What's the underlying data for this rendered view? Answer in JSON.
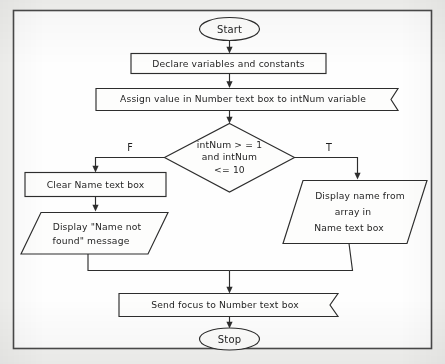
{
  "diagram": {
    "type": "flowchart",
    "frame": {
      "label": "diagram-border"
    },
    "colors": {
      "page_background": "#f3f3f1",
      "canvas": "#fefefe",
      "stroke": "#2d2d2d",
      "frame_stroke": "#4a4a4a",
      "text": "#1f1f1f"
    },
    "nodes": [
      {
        "id": "start",
        "shape": "terminal-oval",
        "name": "start-terminal",
        "text": "Start"
      },
      {
        "id": "declare",
        "shape": "process-rectangle",
        "name": "declare-process",
        "text": "Declare variables and constants"
      },
      {
        "id": "assign",
        "shape": "process-banner",
        "name": "assign-process",
        "text": "Assign value in Number text box to intNum variable"
      },
      {
        "id": "decision",
        "shape": "decision-diamond",
        "name": "range-decision",
        "lines": [
          "intNum > = 1",
          "and intNum",
          "<= 10"
        ]
      },
      {
        "id": "clear",
        "shape": "process-rectangle",
        "name": "clear-name-process",
        "text": "Clear Name text box"
      },
      {
        "id": "not-found",
        "shape": "output-parallelogram",
        "name": "name-not-found-output",
        "lines": [
          "Display \"Name not",
          "found\" message"
        ]
      },
      {
        "id": "display-name",
        "shape": "output-parallelogram",
        "name": "display-name-output",
        "lines": [
          "Display name from",
          "array in",
          "Name text box"
        ]
      },
      {
        "id": "send-focus",
        "shape": "process-banner",
        "name": "send-focus-process",
        "text": "Send focus to Number text box"
      },
      {
        "id": "stop",
        "shape": "terminal-oval",
        "name": "stop-terminal",
        "text": "Stop"
      }
    ],
    "branch_labels": {
      "false": "F",
      "true": "T"
    },
    "edges": [
      {
        "from": "start",
        "to": "declare",
        "label": ""
      },
      {
        "from": "declare",
        "to": "assign",
        "label": ""
      },
      {
        "from": "assign",
        "to": "decision",
        "label": ""
      },
      {
        "from": "decision",
        "to": "clear",
        "label": "F"
      },
      {
        "from": "decision",
        "to": "display-name",
        "label": "T"
      },
      {
        "from": "clear",
        "to": "not-found",
        "label": ""
      },
      {
        "from": "not-found",
        "to": "send-focus",
        "label": ""
      },
      {
        "from": "display-name",
        "to": "send-focus",
        "label": ""
      },
      {
        "from": "send-focus",
        "to": "stop",
        "label": ""
      }
    ]
  }
}
